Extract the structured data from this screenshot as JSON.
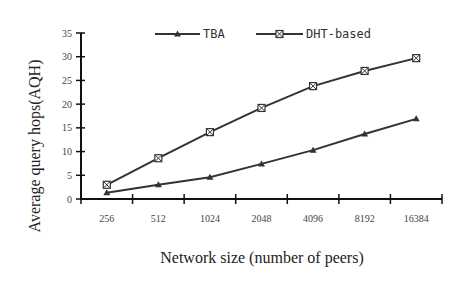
{
  "chart_data": {
    "type": "line",
    "title": "",
    "xlabel": "Network size (number of peers)",
    "ylabel": "Average query hops(AQH)",
    "categories": [
      "256",
      "512",
      "1024",
      "2048",
      "4096",
      "8192",
      "16384"
    ],
    "series": [
      {
        "name": "TBA",
        "marker": "triangle",
        "values": [
          1.3,
          3.0,
          4.6,
          7.4,
          10.3,
          13.7,
          16.9
        ]
      },
      {
        "name": "DHT-based",
        "marker": "crossed-square",
        "values": [
          3.0,
          8.6,
          14.1,
          19.2,
          23.8,
          27.0,
          29.7
        ]
      }
    ],
    "ylim": [
      0,
      35
    ],
    "yticks": [
      0,
      5,
      10,
      15,
      20,
      25,
      30,
      35
    ],
    "grid": false,
    "legend_position": "top-center",
    "colors": {
      "line": "#333333",
      "axis": "#111111",
      "background": "#ffffff"
    }
  }
}
